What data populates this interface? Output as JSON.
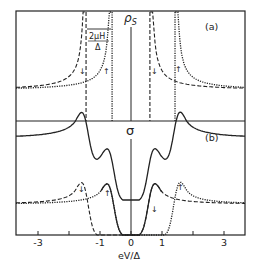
{
  "chart_data": [
    {
      "panel": "(a)",
      "type": "line",
      "ylabel": "ρS",
      "annotation": "2μH/Δ",
      "xlabel": "eV/Δ",
      "xlim": [
        -3.7,
        3.7
      ],
      "series": [
        {
          "name": "spin down",
          "style": "dashed",
          "arrow": "↓",
          "gap_edges": [
            -1.45,
            0.61
          ],
          "baseline": 1.0
        },
        {
          "name": "spin up",
          "style": "dotted",
          "arrow": "↑",
          "gap_edges": [
            -0.61,
            1.42
          ],
          "baseline": 1.0
        }
      ],
      "center_line_x": 0
    },
    {
      "panel": "(b)",
      "type": "line",
      "ylabel": "σ",
      "xlabel": "eV/Δ",
      "xlim": [
        -3.7,
        3.7
      ],
      "x_ticks": [
        -3,
        -2,
        -1,
        0,
        1,
        2,
        3
      ],
      "x_tick_labels": [
        "-3",
        "",
        "-1",
        "0",
        "1",
        "",
        "3"
      ],
      "series": [
        {
          "name": "total",
          "style": "solid",
          "offset": 1.0,
          "peaks": [
            -1.57,
            1.48
          ],
          "peak_height": 3.0,
          "tail": 2.0
        },
        {
          "name": "spin down",
          "style": "dashed",
          "arrow": "↓",
          "peaks": [
            -1.55,
            0.7
          ],
          "peak_height": 1.9,
          "tail": 1.0
        },
        {
          "name": "spin up",
          "style": "dotted",
          "arrow": "↑",
          "peaks": [
            -0.75,
            1.5
          ],
          "peak_height": 1.9,
          "tail": 1.0
        }
      ]
    }
  ],
  "labels": {
    "panel_a": "(a)",
    "panel_b": "(b)",
    "rho": "ρ",
    "rho_sub": "S",
    "sigma": "σ",
    "annot_num": "2μH",
    "annot_den": "Δ",
    "xlabel": "eV/Δ",
    "arrow_down": "↓",
    "arrow_up": "↑"
  },
  "ticks": [
    {
      "v": -3,
      "label": "-3"
    },
    {
      "v": -2,
      "label": ""
    },
    {
      "v": -1,
      "label": "-1"
    },
    {
      "v": 0,
      "label": "0"
    },
    {
      "v": 1,
      "label": "1"
    },
    {
      "v": 2,
      "label": ""
    },
    {
      "v": 3,
      "label": "3"
    }
  ],
  "style": {
    "ink": "#222222",
    "background": "#ffffff"
  }
}
